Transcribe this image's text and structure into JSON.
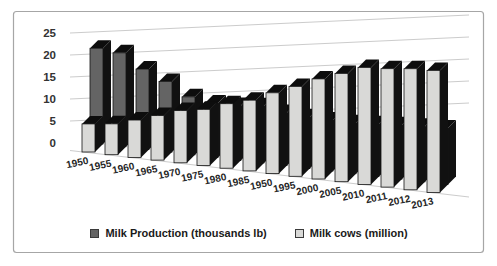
{
  "chart_data": {
    "type": "bar",
    "style": "3d-clustered-column",
    "title": "",
    "categories": [
      "1950",
      "1955",
      "1960",
      "1965",
      "1970",
      "1975",
      "1980",
      "1985",
      "1950",
      "1995",
      "2000",
      "2005",
      "2010",
      "2011",
      "2012",
      "2013"
    ],
    "series": [
      {
        "name": "Milk Production (thousands lb)",
        "color": "#646464",
        "values": [
          22,
          21,
          17.5,
          15,
          12,
          11,
          10.8,
          11,
          10,
          9.5,
          9.2,
          9,
          9.1,
          9.2,
          9.2,
          9.2
        ]
      },
      {
        "name": "Milk cows (million)",
        "color": "#d9d9d7",
        "values": [
          5.3,
          5.8,
          7,
          8.3,
          9.7,
          10.4,
          11.9,
          13,
          14.8,
          16.4,
          18.2,
          19.6,
          21.1,
          21.3,
          21.7,
          21.8
        ]
      }
    ],
    "ylim": [
      0,
      25
    ],
    "yticks": [
      0,
      5,
      10,
      15,
      20,
      25
    ],
    "grid": "on",
    "legend_position": "bottom"
  },
  "colors": {
    "frame": "#a6a6a6",
    "gridline": "#cccccc",
    "bar_edge": "#141414",
    "bar_dark_face": "#646464",
    "bar_light_face": "#d9d9d7",
    "axis_text": "#333333",
    "legend_text": "#1a1a1a"
  }
}
